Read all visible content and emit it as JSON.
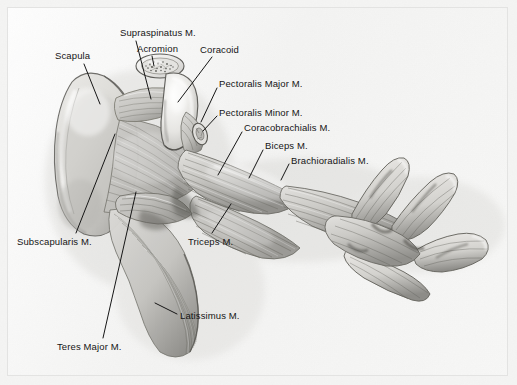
{
  "figure": {
    "plate_background_color": "#f3f3f2",
    "frame_color": "#e3e3e2",
    "ink_color": "#151515",
    "medium": "graphite pencil anatomical rendering",
    "view": "lateral / deep dissection of left pectoral girdle and forelimb"
  },
  "labels": [
    {
      "id": "scapula",
      "text": "Scapula",
      "x": 55,
      "y": 50,
      "leader": {
        "x1": 84,
        "y1": 64,
        "x2": 100,
        "y2": 104
      }
    },
    {
      "id": "supraspinatus",
      "text": "Supraspinatus M.",
      "x": 120,
      "y": 27,
      "leader": {
        "x1": 136,
        "y1": 41,
        "x2": 151,
        "y2": 99
      }
    },
    {
      "id": "acromion",
      "text": "Acromion",
      "x": 137,
      "y": 43,
      "leader": {
        "x1": 152,
        "y1": 56,
        "x2": 154,
        "y2": 66
      }
    },
    {
      "id": "coracoid",
      "text": "Coracoid",
      "x": 200,
      "y": 44,
      "leader": {
        "x1": 212,
        "y1": 57,
        "x2": 178,
        "y2": 102
      }
    },
    {
      "id": "pectoralis-major",
      "text": "Pectoralis Major M.",
      "x": 219,
      "y": 78,
      "leader": {
        "x1": 217,
        "y1": 88,
        "x2": 201,
        "y2": 122
      }
    },
    {
      "id": "pectoralis-minor",
      "text": "Pectoralis Minor M.",
      "x": 219,
      "y": 107,
      "leader": {
        "x1": 217,
        "y1": 116,
        "x2": 203,
        "y2": 131
      }
    },
    {
      "id": "coracobrachialis",
      "text": "Coracobrachialis M.",
      "x": 244,
      "y": 122,
      "leader": {
        "x1": 242,
        "y1": 132,
        "x2": 218,
        "y2": 175
      }
    },
    {
      "id": "biceps",
      "text": "Biceps M.",
      "x": 265,
      "y": 140,
      "leader": {
        "x1": 263,
        "y1": 150,
        "x2": 249,
        "y2": 178
      }
    },
    {
      "id": "brachioradialis",
      "text": "Brachioradialis M.",
      "x": 291,
      "y": 155,
      "leader": {
        "x1": 289,
        "y1": 164,
        "x2": 281,
        "y2": 180
      }
    },
    {
      "id": "subscapularis",
      "text": "Subscapularis M.",
      "x": 17,
      "y": 236,
      "leader": {
        "x1": 76,
        "y1": 233,
        "x2": 115,
        "y2": 134
      }
    },
    {
      "id": "triceps",
      "text": "Triceps M.",
      "x": 188,
      "y": 236,
      "leader": {
        "x1": 212,
        "y1": 233,
        "x2": 231,
        "y2": 204
      }
    },
    {
      "id": "latissimus",
      "text": "Latissimus M.",
      "x": 180,
      "y": 310,
      "leader": {
        "x1": 177,
        "y1": 314,
        "x2": 155,
        "y2": 303
      }
    },
    {
      "id": "teres-major",
      "text": "Teres Major M.",
      "x": 57,
      "y": 341,
      "leader": {
        "x1": 103,
        "y1": 338,
        "x2": 136,
        "y2": 192
      }
    }
  ],
  "structures": [
    {
      "id": "scapula-blade",
      "name": "Scapula blade",
      "kind": "bone"
    },
    {
      "id": "acromion-process",
      "name": "Acromion (cut cross-section)",
      "kind": "bone"
    },
    {
      "id": "coracoid-process",
      "name": "Coracoid process",
      "kind": "bone"
    },
    {
      "id": "supraspinatus-muscle",
      "name": "Supraspinatus M.",
      "kind": "muscle"
    },
    {
      "id": "subscapularis-muscle",
      "name": "Subscapularis M.",
      "kind": "muscle"
    },
    {
      "id": "teres-major-muscle",
      "name": "Teres Major M.",
      "kind": "muscle"
    },
    {
      "id": "latissimus-muscle",
      "name": "Latissimus M.",
      "kind": "muscle"
    },
    {
      "id": "pectoralis-major-muscle",
      "name": "Pectoralis Major M.",
      "kind": "muscle"
    },
    {
      "id": "pectoralis-minor-muscle",
      "name": "Pectoralis Minor M.",
      "kind": "muscle"
    },
    {
      "id": "coracobrachialis-muscle",
      "name": "Coracobrachialis M.",
      "kind": "muscle"
    },
    {
      "id": "biceps-muscle",
      "name": "Biceps M.",
      "kind": "muscle"
    },
    {
      "id": "triceps-muscle",
      "name": "Triceps M.",
      "kind": "muscle"
    },
    {
      "id": "brachioradialis-muscle",
      "name": "Brachioradialis M.",
      "kind": "muscle"
    },
    {
      "id": "manus-digits",
      "name": "Distal limb digital rays",
      "kind": "muscle"
    }
  ]
}
